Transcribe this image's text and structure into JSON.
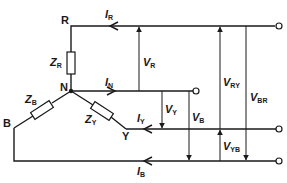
{
  "diagram": {
    "type": "three-phase star-connected load",
    "nodes": {
      "R": "R",
      "N": "N",
      "Y": "Y",
      "B": "B"
    },
    "impedances": {
      "ZR": {
        "sym": "Z",
        "sub": "R"
      },
      "ZY": {
        "sym": "Z",
        "sub": "Y"
      },
      "ZB": {
        "sym": "Z",
        "sub": "B"
      }
    },
    "currents": {
      "IR": {
        "sym": "I",
        "sub": "R"
      },
      "IN": {
        "sym": "I",
        "sub": "N"
      },
      "IY": {
        "sym": "I",
        "sub": "Y"
      },
      "IB": {
        "sym": "I",
        "sub": "B"
      }
    },
    "voltages": {
      "VR": {
        "sym": "V",
        "sub": "R"
      },
      "VY": {
        "sym": "V",
        "sub": "Y"
      },
      "VB": {
        "sym": "V",
        "sub": "B"
      },
      "VRY": {
        "sym": "V",
        "sub": "RY"
      },
      "VBR": {
        "sym": "V",
        "sub": "BR"
      },
      "VYB": {
        "sym": "V",
        "sub": "YB"
      }
    },
    "line_color": "#1a1a1a",
    "background": "#ffffff"
  }
}
